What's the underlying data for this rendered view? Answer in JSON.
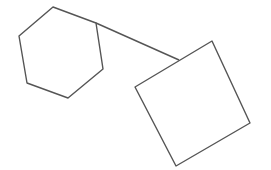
{
  "diagram": {
    "background": "#ffffff",
    "stroke_color": "#555555",
    "stroke_width": 1.4,
    "shapes": [
      {
        "type": "hexagon",
        "name": "hexagon",
        "points": [
          [
            53,
            7
          ],
          [
            96,
            23
          ],
          [
            103,
            69
          ],
          [
            68,
            98
          ],
          [
            27,
            83
          ],
          [
            19,
            36
          ]
        ]
      },
      {
        "type": "square",
        "name": "rotated-square",
        "points": [
          [
            212,
            41
          ],
          [
            250,
            123
          ],
          [
            176,
            166
          ],
          [
            135,
            87
          ]
        ]
      }
    ],
    "connectors": [
      {
        "name": "connector-line",
        "from": [
          96,
          23
        ],
        "to": [
          179,
          60
        ]
      }
    ]
  }
}
